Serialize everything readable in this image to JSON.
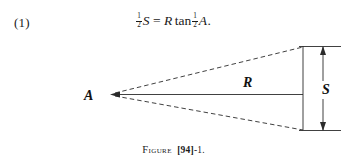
{
  "page": {
    "background_color": "#ffffff",
    "ink_color": "#1a1a1a"
  },
  "equation": {
    "number": "(1)",
    "lhs_fraction_numerator": "1",
    "lhs_fraction_denominator": "2",
    "lhs_variable": "S",
    "operator": "=",
    "rhs_variable": "R",
    "function": "tan",
    "rhs_fraction_numerator": "1",
    "rhs_fraction_denominator": "2",
    "angle_variable": "A",
    "terminator": ".",
    "plain_text": "½S = R tan ½A."
  },
  "figure": {
    "labels": {
      "apex": "A",
      "radius": "R",
      "chord": "S"
    },
    "caption_word": "Figure",
    "caption_bracket_number": "[94]",
    "caption_suffix": "-1.",
    "caption_plain_text": "Figure [94]-1."
  },
  "geometry": {
    "apex_point": [
      112,
      58
    ],
    "chord_top_point": [
      303,
      10
    ],
    "chord_bottom_point": [
      303,
      94
    ],
    "radius_line": [
      [
        112,
        58
      ],
      [
        303,
        58
      ]
    ],
    "upper_side_style": "dashed",
    "lower_side_style": "dashed",
    "radius_line_style": "solid",
    "chord_line_style": "solid",
    "dimension_line_x": 323,
    "dimension_extension_top_y": 10,
    "dimension_extension_bottom_y": 94,
    "apex_arrowhead": "left"
  }
}
